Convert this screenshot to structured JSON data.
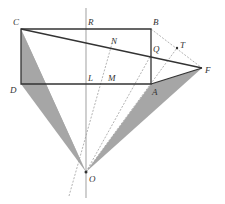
{
  "diagram": {
    "type": "geometry",
    "colors": {
      "line": "#333333",
      "axis": "#b0b0b0",
      "dashed": "#a0a0a0",
      "shade": "#a6a6a6"
    },
    "points": {
      "C": {
        "label": "C",
        "x": 21,
        "y": 29
      },
      "R": {
        "label": "R",
        "x": 86,
        "y": 29
      },
      "B": {
        "label": "B",
        "x": 151,
        "y": 29
      },
      "N": {
        "label": "N",
        "x": 113,
        "y": 43
      },
      "Q": {
        "label": "Q",
        "x": 151,
        "y": 55
      },
      "T": {
        "label": "T",
        "x": 177,
        "y": 48
      },
      "F": {
        "label": "F",
        "x": 202,
        "y": 68
      },
      "D": {
        "label": "D",
        "x": 21,
        "y": 84
      },
      "L": {
        "label": "L",
        "x": 86,
        "y": 84
      },
      "M": {
        "label": "M",
        "x": 106,
        "y": 84
      },
      "A": {
        "label": "A",
        "x": 151,
        "y": 84
      },
      "O": {
        "label": "O",
        "x": 86,
        "y": 172
      }
    }
  }
}
